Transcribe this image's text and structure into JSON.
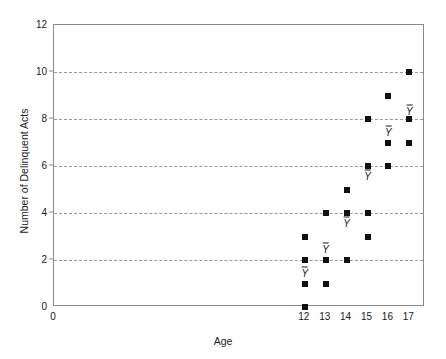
{
  "chart_data": {
    "type": "scatter",
    "title": "",
    "xlabel": "Age",
    "ylabel": "Number of Delinquent Acts",
    "xlim": [
      0,
      17.75
    ],
    "ylim": [
      0,
      12
    ],
    "ytick_labels": [
      "0",
      "2",
      "4",
      "6",
      "8",
      "10",
      "12"
    ],
    "ytick_values": [
      0,
      2,
      4,
      6,
      8,
      10,
      12
    ],
    "xtick_labels": [
      "0",
      "12",
      "13",
      "14",
      "15",
      "16",
      "17"
    ],
    "xtick_values": [
      0,
      12,
      13,
      14,
      15,
      16,
      17
    ],
    "grid": "horizontal-dashed",
    "gridline_values": [
      2,
      4,
      6,
      8,
      10
    ],
    "legend": "none",
    "marker": "filled-square",
    "marker_color": "#101010",
    "groups": [
      {
        "x": 12,
        "values": [
          0,
          1,
          2,
          3
        ],
        "mean": 1.5,
        "mean_label": "Ȳ"
      },
      {
        "x": 13,
        "values": [
          1,
          2,
          4
        ],
        "mean": 2.5,
        "mean_label": "Ȳ"
      },
      {
        "x": 14,
        "values": [
          2,
          4,
          5
        ],
        "mean": 3.6,
        "mean_label": "Ȳ"
      },
      {
        "x": 15,
        "values": [
          3,
          4,
          6,
          8
        ],
        "mean": 5.6,
        "mean_label": "Ȳ"
      },
      {
        "x": 16,
        "values": [
          6,
          7,
          9
        ],
        "mean": 7.5,
        "mean_label": "Ȳ"
      },
      {
        "x": 17,
        "values": [
          7,
          8,
          10
        ],
        "mean": 8.4,
        "mean_label": "Ȳ"
      }
    ]
  }
}
